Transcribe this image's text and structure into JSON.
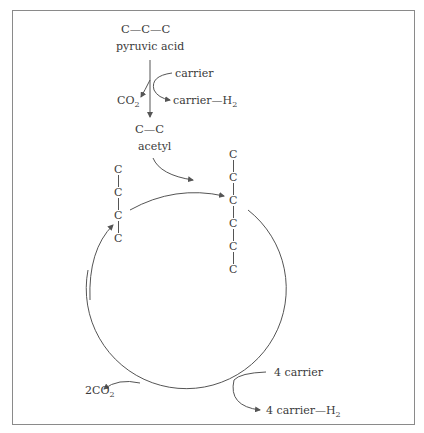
{
  "diagram": {
    "pyruvic": {
      "formula": "C—C—C",
      "label": "pyruvic acid"
    },
    "decarboxylation": {
      "carrier_in": "carrier",
      "co2_out": {
        "text": "CO",
        "sub": "2"
      },
      "carrier_out": {
        "text": "carrier—H",
        "sub": "2"
      }
    },
    "acetyl": {
      "formula": "C—C",
      "label": "acetyl"
    },
    "left_chain": {
      "atoms": [
        "C",
        "C",
        "C",
        "C"
      ]
    },
    "right_chain": {
      "atoms": [
        "C",
        "C",
        "C",
        "C",
        "C",
        "C"
      ]
    },
    "cycle_outputs": {
      "co2": {
        "text": "2CO",
        "sub": "2"
      },
      "carrier_in": "4 carrier",
      "carrier_out": {
        "text": "4 carrier—H",
        "sub": "2"
      }
    },
    "colors": {
      "line": "#555555",
      "frame": "#8a8a8a",
      "text": "#3a3a3a"
    }
  }
}
